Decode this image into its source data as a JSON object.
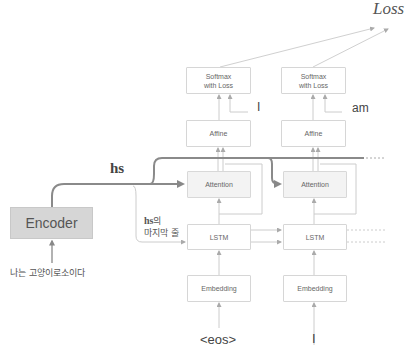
{
  "title": "Loss",
  "encoder": {
    "label": "Encoder",
    "input": "나는 고양이로소이다"
  },
  "hs_label": "hs",
  "hs_last": {
    "bold": "hs",
    "suffix": "의",
    "line2": "마지막 줄"
  },
  "columns": [
    {
      "softmax": "Softmax\nwith Loss",
      "target": "I",
      "affine": "Affine",
      "attention": "Attention",
      "lstm": "LSTM",
      "embedding": "Embedding",
      "input": "<eos>"
    },
    {
      "softmax": "Softmax\nwith Loss",
      "target": "am",
      "affine": "Affine",
      "attention": "Attention",
      "lstm": "LSTM",
      "embedding": "Embedding",
      "input": "I"
    }
  ],
  "colors": {
    "line": "#c8c8c8",
    "thick": "#8a8a8a",
    "encoder_fill": "#d6d6d6",
    "attention_fill": "#f3f3f3"
  }
}
